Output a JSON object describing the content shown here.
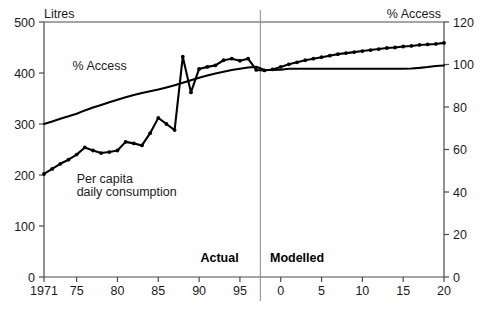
{
  "chart_data": {
    "type": "line",
    "title": "",
    "subtitle": "",
    "ylabel_left": "Litres",
    "ylabel_right": "% Access",
    "xlabel": "",
    "ylim_left": [
      0,
      500
    ],
    "ylim_right": [
      0,
      120
    ],
    "xlim": [
      1971,
      2020
    ],
    "grid": false,
    "legend_position": "inline-annotations",
    "left_ticks": [
      "0",
      "100",
      "200",
      "300",
      "400",
      "500"
    ],
    "left_tick_values": [
      0,
      100,
      200,
      300,
      400,
      500
    ],
    "right_ticks": [
      "0",
      "20",
      "40",
      "60",
      "80",
      "100",
      "120"
    ],
    "right_tick_values": [
      0,
      20,
      40,
      60,
      80,
      100,
      120
    ],
    "x_ticks": [
      "1971",
      "75",
      "80",
      "85",
      "90",
      "95",
      "0",
      "5",
      "10",
      "15",
      "20"
    ],
    "x_tick_values": [
      1971,
      1975,
      1980,
      1985,
      1990,
      1995,
      2000,
      2005,
      2010,
      2015,
      2020
    ],
    "divider_x_value": 1997.5,
    "phase_labels": [
      {
        "text": "Actual",
        "x_value": 1992.5
      },
      {
        "text": "Modelled",
        "x_value": 2002.0
      }
    ],
    "annotations": [
      {
        "text": "% Access",
        "x_value": 1974.5,
        "y_value_left": 405,
        "series": "access"
      },
      {
        "text": "Per capita",
        "x_value": 1975.0,
        "y_value_left": 185,
        "series": "consumption"
      },
      {
        "text": "daily consumption",
        "x_value": 1975.0,
        "y_value_left": 158,
        "series": "consumption"
      }
    ],
    "series": [
      {
        "name": "Per capita daily consumption",
        "axis": "left",
        "unit": "Litres",
        "markers": true,
        "color": "#000000",
        "x": [
          1971,
          1972,
          1973,
          1974,
          1975,
          1976,
          1977,
          1978,
          1979,
          1980,
          1981,
          1982,
          1983,
          1984,
          1985,
          1986,
          1987,
          1988,
          1989,
          1990,
          1991,
          1992,
          1993,
          1994,
          1995,
          1996,
          1997,
          1998,
          1999,
          2000,
          2001,
          2002,
          2003,
          2004,
          2005,
          2006,
          2007,
          2008,
          2009,
          2010,
          2011,
          2012,
          2013,
          2014,
          2015,
          2016,
          2017,
          2018,
          2019,
          2020
        ],
        "values": [
          202,
          212,
          222,
          230,
          240,
          254,
          248,
          243,
          245,
          248,
          265,
          262,
          258,
          282,
          312,
          300,
          288,
          432,
          362,
          408,
          412,
          415,
          425,
          428,
          424,
          428,
          406,
          405,
          407,
          412,
          417,
          421,
          425,
          428,
          431,
          434,
          437,
          439,
          441,
          443,
          445,
          447,
          449,
          450,
          452,
          453,
          455,
          456,
          457,
          459
        ]
      },
      {
        "name": "% Access",
        "axis": "right",
        "unit": "%",
        "markers": false,
        "color": "#000000",
        "x": [
          1971,
          1972,
          1973,
          1974,
          1975,
          1976,
          1977,
          1978,
          1979,
          1980,
          1981,
          1982,
          1983,
          1984,
          1985,
          1986,
          1987,
          1988,
          1989,
          1990,
          1991,
          1992,
          1993,
          1994,
          1995,
          1996,
          1997,
          1998,
          1999,
          2000,
          2001,
          2002,
          2003,
          2004,
          2005,
          2006,
          2007,
          2008,
          2009,
          2010,
          2011,
          2012,
          2013,
          2014,
          2015,
          2016,
          2017,
          2018,
          2019,
          2020
        ],
        "values": [
          72.0,
          73.2,
          74.5,
          75.6,
          76.8,
          78.4,
          79.8,
          81.0,
          82.2,
          83.4,
          84.6,
          85.6,
          86.6,
          87.4,
          88.2,
          89.2,
          90.2,
          91.4,
          92.6,
          93.8,
          94.8,
          95.8,
          96.6,
          97.4,
          98.0,
          98.6,
          98.9,
          97.4,
          97.4,
          97.5,
          98.0,
          98.0,
          98.0,
          98.0,
          98.0,
          98.0,
          98.0,
          98.0,
          98.0,
          98.0,
          98.0,
          98.0,
          98.0,
          98.0,
          98.0,
          98.1,
          98.4,
          98.8,
          99.3,
          99.5
        ]
      }
    ]
  },
  "figure": {
    "background_color": "#ffffff",
    "axis_color": "#4a4a4a",
    "line_color": "#000000"
  }
}
